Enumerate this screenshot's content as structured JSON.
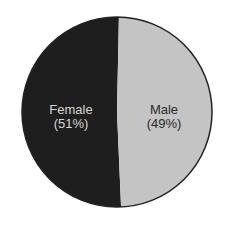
{
  "chart_data": {
    "type": "pie",
    "title": "",
    "labels": [
      "Female",
      "Male"
    ],
    "values": [
      51,
      49
    ],
    "value_labels": [
      "(51%)",
      "(49%)"
    ],
    "colors": [
      "#1e1e1e",
      "#c4c4c4"
    ],
    "label_colors": [
      "#d6d6d6",
      "#2a2a2a"
    ],
    "legend": "none"
  }
}
